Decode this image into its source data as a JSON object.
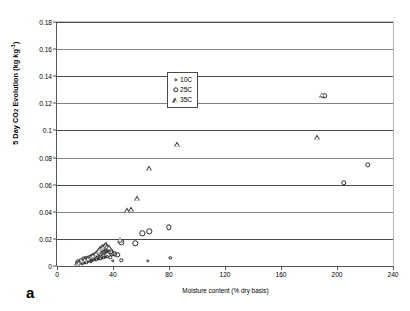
{
  "figure": {
    "panel_letter": "a"
  },
  "chart_data": {
    "type": "scatter",
    "title": "",
    "xlabel": "Moisture content (% dry basis)",
    "ylabel": "5 Day CO2 Evolution (kg kg-1)",
    "ylabel_parts": {
      "prefix": "5 Day CO",
      "sub": "2",
      "mid": " Evolution (kg kg",
      "sup": "-1",
      "suffix": ")"
    },
    "xlim": [
      0,
      240
    ],
    "ylim": [
      0,
      0.18
    ],
    "xticks": [
      0,
      40,
      80,
      120,
      160,
      200,
      240
    ],
    "xtick_labels": [
      "0",
      "40",
      "80",
      "120",
      "160",
      "200",
      "240"
    ],
    "yticks": [
      0,
      0.02,
      0.04,
      0.06,
      0.08,
      0.1,
      0.12,
      0.14,
      0.16,
      0.18
    ],
    "ytick_labels": [
      "0",
      "0.02",
      "0.04",
      "0.06",
      "0.08",
      "0.1",
      "0.12",
      "0.14",
      "0.16",
      "0.18"
    ],
    "grid": "horizontal",
    "legend_position": "upper-left-inset",
    "legend": [
      {
        "label": "10C",
        "marker": "small-circle"
      },
      {
        "label": "25C",
        "marker": "circle"
      },
      {
        "label": "35C",
        "marker": "triangle"
      }
    ],
    "series": [
      {
        "name": "10C",
        "marker": "small-circle",
        "points": [
          [
            14,
            0.0015
          ],
          [
            16,
            0.0018
          ],
          [
            17,
            0.0022
          ],
          [
            18,
            0.002
          ],
          [
            19,
            0.0026
          ],
          [
            20,
            0.003
          ],
          [
            21,
            0.0028
          ],
          [
            22,
            0.0034
          ],
          [
            23,
            0.0038
          ],
          [
            24,
            0.0036
          ],
          [
            25,
            0.0042
          ],
          [
            26,
            0.0046
          ],
          [
            27,
            0.0044
          ],
          [
            28,
            0.005
          ],
          [
            29,
            0.0054
          ],
          [
            30,
            0.0052
          ],
          [
            31,
            0.0058
          ],
          [
            32,
            0.0062
          ],
          [
            33,
            0.006
          ],
          [
            34,
            0.0066
          ],
          [
            35,
            0.007
          ],
          [
            36,
            0.0068
          ],
          [
            38,
            0.0064
          ],
          [
            40,
            0.004
          ],
          [
            46,
            0.0042
          ],
          [
            65,
            0.004
          ],
          [
            81,
            0.006
          ]
        ]
      },
      {
        "name": "25C",
        "marker": "circle",
        "points": [
          [
            15,
            0.003
          ],
          [
            17,
            0.004
          ],
          [
            19,
            0.0048
          ],
          [
            21,
            0.0055
          ],
          [
            23,
            0.0062
          ],
          [
            25,
            0.007
          ],
          [
            27,
            0.0078
          ],
          [
            29,
            0.0085
          ],
          [
            31,
            0.0092
          ],
          [
            33,
            0.0098
          ],
          [
            34,
            0.0105
          ],
          [
            35,
            0.0112
          ],
          [
            36,
            0.0118
          ],
          [
            37,
            0.0125
          ],
          [
            38,
            0.0108
          ],
          [
            39,
            0.0095
          ],
          [
            41,
            0.0088
          ],
          [
            43,
            0.0082
          ],
          [
            46,
            0.0175
          ],
          [
            56,
            0.0168
          ],
          [
            61,
            0.024
          ],
          [
            66,
            0.0255
          ],
          [
            80,
            0.0285
          ],
          [
            191,
            0.1255
          ],
          [
            205,
            0.0615
          ],
          [
            222,
            0.0745
          ]
        ]
      },
      {
        "name": "35C",
        "marker": "triangle",
        "points": [
          [
            14,
            0.0022
          ],
          [
            16,
            0.003
          ],
          [
            18,
            0.004
          ],
          [
            20,
            0.005
          ],
          [
            22,
            0.006
          ],
          [
            24,
            0.0072
          ],
          [
            26,
            0.0084
          ],
          [
            28,
            0.0096
          ],
          [
            29,
            0.0108
          ],
          [
            30,
            0.012
          ],
          [
            31,
            0.0132
          ],
          [
            32,
            0.014
          ],
          [
            33,
            0.0148
          ],
          [
            34,
            0.0155
          ],
          [
            35,
            0.016
          ],
          [
            36,
            0.015
          ],
          [
            37,
            0.0138
          ],
          [
            45,
            0.0195
          ],
          [
            50,
            0.041
          ],
          [
            53,
            0.042
          ],
          [
            57,
            0.05
          ],
          [
            66,
            0.072
          ],
          [
            86,
            0.09
          ],
          [
            186,
            0.095
          ],
          [
            189,
            0.1265
          ]
        ]
      }
    ]
  }
}
